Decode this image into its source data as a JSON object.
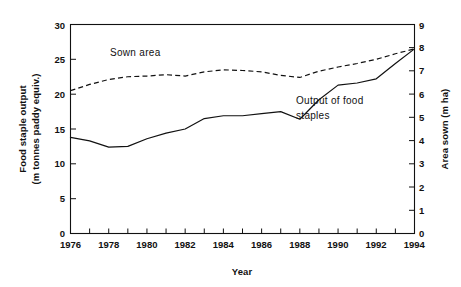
{
  "chart_data": {
    "type": "line",
    "title": "",
    "xlabel": "Year",
    "ylabel": "Food staple output (m tonnes paddy equiv.)",
    "ylabel_line1": "Food staple output",
    "ylabel_line2": "(m tonnes paddy equiv.)",
    "y2label": "Area sown (m ha)",
    "grid": false,
    "legend_position": "inline-annotation",
    "x": [
      1976,
      1977,
      1978,
      1979,
      1980,
      1981,
      1982,
      1983,
      1984,
      1985,
      1986,
      1987,
      1988,
      1989,
      1990,
      1991,
      1992,
      1993,
      1994
    ],
    "xlim": [
      1976,
      1994
    ],
    "xticks": [
      1976,
      1977,
      1978,
      1979,
      1980,
      1981,
      1982,
      1983,
      1984,
      1985,
      1986,
      1987,
      1988,
      1989,
      1990,
      1991,
      1992,
      1993,
      1994
    ],
    "xtick_labels": [
      "1976",
      "",
      "1978",
      "",
      "1980",
      "",
      "1982",
      "",
      "1984",
      "",
      "1986",
      "",
      "1988",
      "",
      "1990",
      "",
      "1992",
      "",
      "1994"
    ],
    "xtick_labels_shown": [
      "1976",
      "1978",
      "1980",
      "1982",
      "1984",
      "1986",
      "1988",
      "1990",
      "1992",
      "1994"
    ],
    "ylim": [
      0,
      30
    ],
    "yticks": [
      0,
      5,
      10,
      15,
      20,
      25,
      30
    ],
    "ytick_labels": [
      "0",
      "5",
      "10",
      "15",
      "20",
      "25",
      "30"
    ],
    "y2lim": [
      0,
      9
    ],
    "y2ticks": [
      0,
      1,
      2,
      3,
      4,
      5,
      6,
      7,
      8,
      9
    ],
    "y2tick_labels": [
      "0",
      "1",
      "2",
      "3",
      "4",
      "5",
      "6",
      "7",
      "8",
      "9"
    ],
    "series": [
      {
        "name": "Output of food staples",
        "axis": "left",
        "style": "solid",
        "color": "#111111",
        "label_text": "Output of food",
        "label_text_line2": "staples",
        "values": [
          13.8,
          13.3,
          12.4,
          12.5,
          13.6,
          14.4,
          15.0,
          16.5,
          16.9,
          16.9,
          17.2,
          17.5,
          16.4,
          19.2,
          21.3,
          21.6,
          22.2,
          24.4,
          26.5
        ]
      },
      {
        "name": "Sown area",
        "axis": "right",
        "style": "dashed",
        "color": "#111111",
        "label_text": "Sown area",
        "values": [
          20.5,
          21.4,
          22.1,
          22.5,
          22.6,
          22.8,
          22.6,
          23.2,
          23.5,
          23.4,
          23.2,
          22.7,
          22.4,
          23.3,
          23.9,
          24.4,
          25.0,
          25.8,
          26.5
        ],
        "values_right_axis": [
          6.15,
          6.42,
          6.63,
          6.75,
          6.78,
          6.84,
          6.78,
          6.96,
          7.05,
          7.02,
          6.96,
          6.81,
          6.72,
          6.99,
          7.17,
          7.32,
          7.5,
          7.74,
          7.95
        ]
      }
    ]
  }
}
